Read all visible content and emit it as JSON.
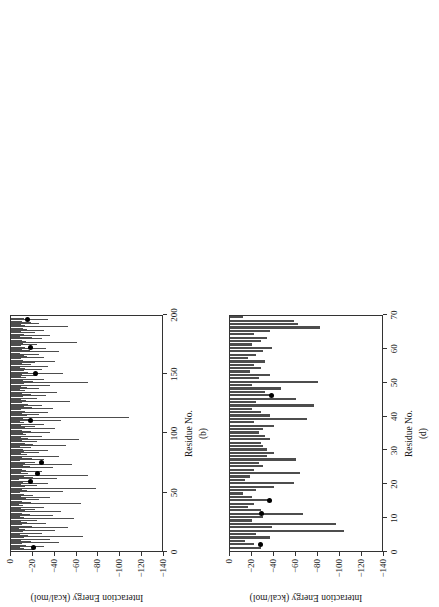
{
  "figure": {
    "background": "#ffffff",
    "bar_color": "#4d4d4d",
    "marker_color": "#000000",
    "axis_color": "#333333",
    "rotation_note": "panels rendered rotated 90 degrees counter-clockwise"
  },
  "chart_data": [
    {
      "type": "bar",
      "panel": "a",
      "caption": "(a)",
      "title": "",
      "xlabel": "Residue No.",
      "ylabel": "Interaction Energy (kcal/mol)",
      "xlim": [
        0,
        180
      ],
      "ylim": [
        -140,
        0
      ],
      "xticks": [
        0,
        20,
        40,
        60,
        80,
        100,
        120,
        140,
        160,
        180
      ],
      "yticks": [
        0,
        -20,
        -40,
        -60,
        -80,
        -100,
        -120,
        -140
      ],
      "grid": false,
      "legend": "none",
      "orientation": "horizontal-bars-rotated",
      "x": [
        1,
        2,
        3,
        4,
        5,
        6,
        7,
        8,
        9,
        10,
        11,
        12,
        13,
        14,
        15,
        16,
        17,
        18,
        19,
        20,
        21,
        22,
        23,
        24,
        25,
        26,
        27,
        28,
        29,
        30,
        31,
        32,
        33,
        34,
        35,
        36,
        37,
        38,
        39,
        40,
        41,
        42,
        43,
        44,
        45,
        46,
        47,
        48,
        49,
        50,
        51,
        52,
        53,
        54,
        55,
        56,
        57,
        58,
        59,
        60,
        61,
        62,
        63,
        64,
        65,
        66,
        67,
        68,
        69,
        70,
        71,
        72,
        73,
        74,
        75,
        76,
        77,
        78,
        79,
        80,
        81,
        82,
        83,
        84,
        85,
        86,
        87,
        88,
        89,
        90,
        91,
        92,
        93,
        94,
        95,
        96,
        97,
        98,
        99,
        100,
        101,
        102,
        103,
        104,
        105,
        106,
        107,
        108,
        109,
        110,
        111,
        112,
        113,
        114,
        115,
        116,
        117,
        118,
        119,
        120,
        121,
        122,
        123,
        124,
        125,
        126,
        127,
        128,
        129,
        130,
        131,
        132,
        133,
        134,
        135,
        136,
        137,
        138,
        139,
        140,
        141,
        142,
        143,
        144,
        145,
        146,
        147,
        148,
        149,
        150,
        151,
        152,
        153,
        154,
        155,
        156,
        157,
        158,
        159,
        160,
        161,
        162,
        163,
        164,
        165,
        166,
        167,
        168,
        169,
        170,
        171,
        172,
        173,
        174,
        175,
        176,
        177,
        178,
        179,
        180
      ],
      "values": [
        -14,
        -22,
        -12,
        -30,
        -9,
        -18,
        -6,
        -42,
        -11,
        -25,
        -14,
        -70,
        -18,
        -9,
        -33,
        -12,
        -80,
        -20,
        -8,
        -38,
        -52,
        -16,
        -11,
        -26,
        -14,
        -9,
        -30,
        -60,
        -18,
        -7,
        -44,
        -100,
        -22,
        -10,
        -36,
        -15,
        -68,
        -12,
        -28,
        -48,
        -16,
        -9,
        -34,
        -11,
        -25,
        -7,
        -40,
        -13,
        -90,
        -19,
        -8,
        -30,
        -55,
        -14,
        -10,
        -24,
        -38,
        -12,
        -7,
        -45,
        -20,
        -9,
        -64,
        -16,
        -11,
        -28,
        -34,
        -13,
        -8,
        -50,
        -22,
        -10,
        -18,
        -30,
        -42,
        -14,
        -9,
        -26,
        -12,
        -78,
        -20,
        -8,
        -36,
        -95,
        -15,
        -10,
        -32,
        -13,
        -24,
        -9,
        -58,
        -18,
        -11,
        -60,
        -28,
        -14,
        -8,
        -40,
        -22,
        -10,
        -120,
        -16,
        -9,
        -35,
        -12,
        -96,
        -26,
        -11,
        -20,
        -7,
        -44,
        -14,
        -18,
        -30,
        -10,
        -75,
        -22,
        -9,
        -38,
        -12,
        -16,
        -62,
        -25,
        -8,
        -34,
        -88,
        -13,
        -20,
        -10,
        -46,
        -15,
        -28,
        -9,
        -70,
        -12,
        -24,
        -18,
        -92,
        -11,
        -36,
        -8,
        -52,
        -14,
        -22,
        -30,
        -10,
        -66,
        -16,
        -9,
        -40,
        -12,
        -26,
        -74,
        -18,
        -11,
        -32,
        -8,
        -58,
        -20,
        -13,
        -44,
        -10,
        -24,
        -80,
        -15,
        -9,
        -36,
        -12,
        -28,
        -84,
        -18,
        -10,
        -50,
        -14,
        -22,
        -8,
        -64,
        -30,
        -12,
        -9,
        -76,
        -20
      ],
      "markers": [
        {
          "x": 3,
          "y": -14
        },
        {
          "x": 22,
          "y": -15
        },
        {
          "x": 26,
          "y": -18
        },
        {
          "x": 41,
          "y": -17
        },
        {
          "x": 63,
          "y": -16
        },
        {
          "x": 93,
          "y": -60
        },
        {
          "x": 100,
          "y": -19
        },
        {
          "x": 158,
          "y": -22
        },
        {
          "x": 166,
          "y": -18
        }
      ]
    },
    {
      "type": "bar",
      "panel": "b",
      "caption": "(b)",
      "title": "",
      "xlabel": "Residue No.",
      "ylabel": "Interaction Energy (kcal/mol)",
      "xlim": [
        0,
        200
      ],
      "ylim": [
        -140,
        0
      ],
      "xticks": [
        0,
        50,
        100,
        150,
        200
      ],
      "yticks": [
        0,
        -20,
        -40,
        -60,
        -80,
        -100,
        -120,
        -140
      ],
      "grid": false,
      "legend": "none",
      "orientation": "horizontal-bars-rotated",
      "x": [
        1,
        2,
        3,
        4,
        5,
        6,
        7,
        8,
        9,
        10,
        11,
        12,
        13,
        14,
        15,
        16,
        17,
        18,
        19,
        20,
        21,
        22,
        23,
        24,
        25,
        26,
        27,
        28,
        29,
        30,
        31,
        32,
        33,
        34,
        35,
        36,
        37,
        38,
        39,
        40,
        41,
        42,
        43,
        44,
        45,
        46,
        47,
        48,
        49,
        50,
        51,
        52,
        53,
        54,
        55,
        56,
        57,
        58,
        59,
        60,
        61,
        62,
        63,
        64,
        65,
        66,
        67,
        68,
        69,
        70,
        71,
        72,
        73,
        74,
        75,
        76,
        77,
        78,
        79,
        80,
        81,
        82,
        83,
        84,
        85,
        86,
        87,
        88,
        89,
        90,
        91,
        92,
        93,
        94,
        95,
        96,
        97,
        98,
        99,
        100,
        101,
        102,
        103,
        104,
        105,
        106,
        107,
        108,
        109,
        110,
        111,
        112,
        113,
        114,
        115,
        116,
        117,
        118,
        119,
        120,
        121,
        122,
        123,
        124,
        125,
        126,
        127,
        128,
        129,
        130,
        131,
        132,
        133,
        134,
        135,
        136,
        137,
        138,
        139,
        140,
        141,
        142,
        143,
        144,
        145,
        146,
        147,
        148,
        149,
        150,
        151,
        152,
        153,
        154,
        155,
        156,
        157,
        158,
        159,
        160,
        161,
        162,
        163,
        164,
        165,
        166,
        167,
        168,
        169,
        170,
        171,
        172,
        173,
        174,
        175,
        176,
        177,
        178,
        179,
        180,
        181,
        182,
        183,
        184,
        185,
        186,
        187,
        188,
        189,
        190,
        191,
        192,
        193,
        194,
        195,
        196,
        197,
        198,
        199,
        200
      ],
      "values": [
        -20,
        -12,
        -8,
        -30,
        -14,
        -10,
        -44,
        -18,
        -9,
        -36,
        -12,
        -66,
        -16,
        -8,
        -28,
        -11,
        -40,
        -13,
        -7,
        -52,
        -19,
        -10,
        -32,
        -15,
        -9,
        -24,
        -58,
        -12,
        -8,
        -38,
        -17,
        -10,
        -46,
        -13,
        -22,
        -9,
        -30,
        -11,
        -7,
        -64,
        -18,
        -10,
        -26,
        -14,
        -36,
        -9,
        -20,
        -12,
        -8,
        -48,
        -15,
        -10,
        -78,
        -13,
        -24,
        -9,
        -34,
        -11,
        -18,
        -7,
        -42,
        -20,
        -12,
        -70,
        -16,
        -9,
        -28,
        -14,
        -10,
        -38,
        -17,
        -11,
        -56,
        -13,
        -22,
        -8,
        -30,
        -19,
        -10,
        -44,
        -15,
        -9,
        -26,
        -12,
        -34,
        -11,
        -18,
        -8,
        -50,
        -20,
        -13,
        -24,
        -10,
        -62,
        -16,
        -9,
        -28,
        -14,
        -11,
        -36,
        -18,
        -10,
        -40,
        -13,
        -22,
        -9,
        -30,
        -12,
        -8,
        -46,
        -17,
        -11,
        -108,
        -15,
        -26,
        -10,
        -34,
        -13,
        -9,
        -38,
        -19,
        -12,
        -28,
        -16,
        -10,
        -54,
        -14,
        -9,
        -24,
        -11,
        -32,
        -18,
        -10,
        -42,
        -13,
        -8,
        -26,
        -15,
        -9,
        -36,
        -12,
        -70,
        -20,
        -11,
        -30,
        -14,
        -9,
        -24,
        -10,
        -48,
        -16,
        -12,
        -28,
        -13,
        -8,
        -34,
        -18,
        -10,
        -22,
        -40,
        -11,
        -9,
        -30,
        -15,
        -12,
        -26,
        -8,
        -44,
        -17,
        -10,
        -32,
        -13,
        -9,
        -24,
        -11,
        -60,
        -14,
        -10,
        -28,
        -19,
        -8,
        -36,
        -12,
        -22,
        -9,
        -30,
        -15,
        -11,
        -52,
        -13,
        -9,
        -26,
        -18,
        -10,
        -34,
        -12
      ],
      "markers": [
        {
          "x": 3,
          "y": -21
        },
        {
          "x": 59,
          "y": -18
        },
        {
          "x": 65,
          "y": -24
        },
        {
          "x": 75,
          "y": -28
        },
        {
          "x": 110,
          "y": -18
        },
        {
          "x": 150,
          "y": -22
        },
        {
          "x": 172,
          "y": -18
        },
        {
          "x": 195,
          "y": -15
        }
      ]
    },
    {
      "type": "bar",
      "panel": "c",
      "caption": "(c)",
      "title": "",
      "xlabel": "Residue No.",
      "ylabel": "Interaction Energy (kcal/mol)",
      "xlim": [
        0,
        53
      ],
      "ylim": [
        -140,
        0
      ],
      "xticks": [
        0,
        10,
        20,
        30,
        40,
        50
      ],
      "yticks": [
        0,
        -20,
        -40,
        -60,
        -80,
        -100,
        -120,
        -140
      ],
      "grid": false,
      "legend": "none",
      "orientation": "horizontal-bars-rotated",
      "x": [
        1,
        2,
        3,
        4,
        5,
        6,
        7,
        8,
        9,
        10,
        11,
        12,
        13,
        14,
        15,
        16,
        17,
        18,
        19,
        20,
        21,
        22,
        23,
        24,
        25,
        26,
        27,
        28,
        29,
        30,
        31,
        32,
        33,
        34,
        35,
        36,
        37,
        38,
        39,
        40,
        41,
        42,
        43,
        44,
        45,
        46,
        47,
        48,
        49,
        50,
        51,
        52
      ],
      "values": [
        -12,
        -72,
        -48,
        -72,
        -38,
        -20,
        -20,
        -8,
        -10,
        -56,
        -56,
        -40,
        -26,
        -22,
        -18,
        -18,
        -6,
        -58,
        -3,
        -12,
        -30,
        -20,
        -32,
        -44,
        -14,
        -50,
        -52,
        -20,
        -38,
        -18,
        -22,
        -6,
        -56,
        -30,
        -18,
        -16,
        -14,
        -8,
        -20,
        -24,
        -10,
        -6,
        -78,
        -34,
        -26,
        -14,
        -30,
        -20,
        -12,
        -28,
        -16,
        -10
      ],
      "markers": [
        {
          "x": 7,
          "y": -20
        },
        {
          "x": 17,
          "y": -17
        },
        {
          "x": 29,
          "y": -53
        },
        {
          "x": 35,
          "y": -22
        },
        {
          "x": 51,
          "y": -24
        }
      ]
    },
    {
      "type": "bar",
      "panel": "d",
      "caption": "(d)",
      "title": "",
      "xlabel": "Residue No.",
      "ylabel": "Interaction Energy (kcal/mol)",
      "xlim": [
        0,
        70
      ],
      "ylim": [
        -140,
        0
      ],
      "xticks": [
        0,
        10,
        20,
        30,
        40,
        50,
        60,
        70
      ],
      "yticks": [
        0,
        -20,
        -40,
        -60,
        -80,
        -100,
        -120,
        -140
      ],
      "grid": false,
      "legend": "none",
      "orientation": "horizontal-bars-rotated",
      "x": [
        1,
        2,
        3,
        4,
        5,
        6,
        7,
        8,
        9,
        10,
        11,
        12,
        13,
        14,
        15,
        16,
        17,
        18,
        19,
        20,
        21,
        22,
        23,
        24,
        25,
        26,
        27,
        28,
        29,
        30,
        31,
        32,
        33,
        34,
        35,
        36,
        37,
        38,
        39,
        40,
        41,
        42,
        43,
        44,
        45,
        46,
        47,
        48,
        49,
        50,
        51,
        52,
        53,
        54,
        55,
        56,
        57,
        58,
        59,
        60,
        61,
        62,
        63,
        64,
        65,
        66,
        67,
        68,
        69
      ],
      "values": [
        -28,
        -22,
        -14,
        -36,
        -24,
        -104,
        -38,
        -96,
        -20,
        -30,
        -66,
        -28,
        -16,
        -22,
        -36,
        -20,
        -12,
        -24,
        -40,
        -58,
        -14,
        -18,
        -64,
        -22,
        -30,
        -26,
        -60,
        -34,
        -40,
        -34,
        -30,
        -28,
        -36,
        -32,
        -26,
        -30,
        -40,
        -22,
        -70,
        -36,
        -28,
        -20,
        -76,
        -24,
        -60,
        -38,
        -32,
        -46,
        -20,
        -80,
        -26,
        -36,
        -18,
        -28,
        -22,
        -32,
        -16,
        -24,
        -30,
        -38,
        -20,
        -28,
        -34,
        -22,
        -36,
        -82,
        -62,
        -58,
        -12
      ],
      "markers": [
        {
          "x": 2,
          "y": -28
        },
        {
          "x": 11,
          "y": -29
        },
        {
          "x": 15,
          "y": -36
        },
        {
          "x": 46,
          "y": -38
        }
      ]
    }
  ]
}
